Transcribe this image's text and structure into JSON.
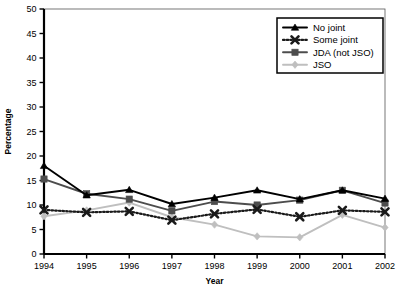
{
  "chart_data": {
    "type": "line",
    "title": "",
    "xlabel": "Year",
    "ylabel": "Percentage",
    "categories": [
      "1994",
      "1995",
      "1996",
      "1997",
      "1998",
      "1999",
      "2000",
      "2001",
      "2002"
    ],
    "x": [
      1994,
      1995,
      1996,
      1997,
      1998,
      1999,
      2000,
      2001,
      2002
    ],
    "xlim": [
      1994,
      2002
    ],
    "ylim": [
      0,
      50
    ],
    "ytick_labels": [
      "0",
      "5",
      "10",
      "15",
      "20",
      "25",
      "30",
      "35",
      "40",
      "45",
      "50"
    ],
    "yticks": [
      0,
      5,
      10,
      15,
      20,
      25,
      30,
      35,
      40,
      45,
      50
    ],
    "grid": false,
    "legend_position": "top-right",
    "series": [
      {
        "name": "No joint",
        "marker": "triangle",
        "color": "#000000",
        "linestyle": "solid",
        "values": [
          18.0,
          12.0,
          13.1,
          10.2,
          11.5,
          13.0,
          11.2,
          13.0,
          11.3
        ]
      },
      {
        "name": "Some joint",
        "marker": "x",
        "color": "#1a1a1a",
        "linestyle": "dotted",
        "values": [
          9.0,
          8.5,
          8.7,
          6.9,
          8.2,
          9.1,
          7.6,
          8.9,
          8.6
        ]
      },
      {
        "name": "JDA (not JSO)",
        "marker": "square",
        "color": "#4d4d4d",
        "linestyle": "solid",
        "values": [
          15.3,
          12.3,
          11.2,
          8.8,
          10.7,
          10.0,
          11.0,
          13.0,
          10.4
        ]
      },
      {
        "name": "JSO",
        "marker": "diamond",
        "color": "#bfbfbf",
        "linestyle": "solid",
        "values": [
          7.7,
          8.9,
          10.5,
          7.5,
          6.0,
          3.6,
          3.4,
          8.0,
          5.4
        ]
      }
    ]
  },
  "axes": {
    "ylabel": "Percentage",
    "xlabel": "Year"
  },
  "legend": {
    "entries": [
      {
        "label": "No joint"
      },
      {
        "label": "Some joint"
      },
      {
        "label": "JDA (not JSO)"
      },
      {
        "label": "JSO"
      }
    ]
  }
}
